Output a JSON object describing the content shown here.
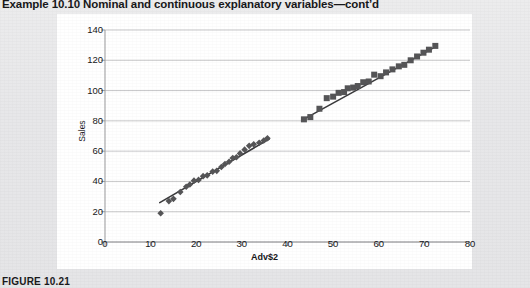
{
  "page": {
    "header_title": "Example 10.10  Nominal and continuous explanatory variables—cont’d",
    "figure_caption": "FIGURE 10.21",
    "background_color": "#e9e9ea",
    "card_color": "#ffffff"
  },
  "chart_data": {
    "type": "scatter",
    "title": "",
    "xlabel": "Adv$2",
    "ylabel": "Sales",
    "xlim": [
      0,
      80
    ],
    "ylim": [
      0,
      140
    ],
    "xticks": [
      0,
      10,
      20,
      30,
      40,
      50,
      60,
      70,
      80
    ],
    "yticks": [
      0,
      20,
      40,
      60,
      80,
      100,
      120,
      140
    ],
    "grid": "horizontal",
    "grid_color": "#b9b9bb",
    "legend": "none",
    "marker_color": "#555557",
    "trendline_color": "#3a3a3c",
    "series": [
      {
        "name": "Group 1",
        "marker": "diamond",
        "points": [
          [
            12.2,
            19.0
          ],
          [
            14.0,
            27.0
          ],
          [
            15.0,
            28.5
          ],
          [
            16.5,
            33.0
          ],
          [
            17.8,
            36.5
          ],
          [
            18.6,
            38.0
          ],
          [
            19.5,
            40.5
          ],
          [
            20.5,
            41.0
          ],
          [
            21.5,
            43.5
          ],
          [
            22.4,
            44.0
          ],
          [
            23.6,
            46.5
          ],
          [
            24.5,
            47.0
          ],
          [
            25.5,
            49.5
          ],
          [
            26.3,
            51.5
          ],
          [
            27.2,
            53.0
          ],
          [
            28.0,
            55.5
          ],
          [
            28.8,
            56.0
          ],
          [
            29.6,
            58.5
          ],
          [
            30.6,
            61.0
          ],
          [
            31.6,
            63.5
          ],
          [
            32.6,
            64.5
          ],
          [
            33.8,
            65.5
          ],
          [
            34.8,
            67.0
          ],
          [
            35.6,
            68.5
          ]
        ],
        "trendline": {
          "x0": 12.0,
          "y0": 26.0,
          "x1": 36.0,
          "y1": 68.0
        }
      },
      {
        "name": "Group 2",
        "marker": "square",
        "points": [
          [
            43.6,
            81.0
          ],
          [
            45.0,
            82.5
          ],
          [
            47.0,
            88.0
          ],
          [
            48.6,
            95.0
          ],
          [
            50.0,
            96.0
          ],
          [
            51.2,
            98.5
          ],
          [
            52.4,
            99.0
          ],
          [
            53.2,
            101.5
          ],
          [
            54.4,
            102.0
          ],
          [
            55.4,
            103.0
          ],
          [
            56.6,
            105.5
          ],
          [
            57.8,
            106.0
          ],
          [
            59.0,
            110.5
          ],
          [
            60.4,
            109.5
          ],
          [
            61.6,
            112.0
          ],
          [
            63.0,
            114.0
          ],
          [
            64.4,
            116.0
          ],
          [
            65.6,
            117.0
          ],
          [
            67.0,
            120.0
          ],
          [
            68.4,
            122.5
          ],
          [
            69.8,
            125.0
          ],
          [
            71.0,
            127.0
          ],
          [
            72.4,
            129.5
          ]
        ],
        "trendline": {
          "x0": 43.5,
          "y0": 81.0,
          "x1": 72.5,
          "y1": 129.0
        }
      }
    ]
  }
}
